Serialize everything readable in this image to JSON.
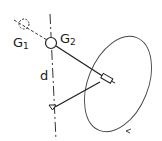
{
  "diagram": {
    "labels": {
      "g1": {
        "main": "G",
        "sub": "1"
      },
      "g2": {
        "main": "G",
        "sub": "2"
      },
      "d": "d"
    },
    "colors": {
      "stroke": "#222222",
      "background": "#ffffff"
    }
  }
}
